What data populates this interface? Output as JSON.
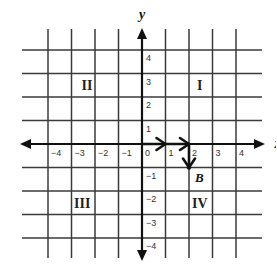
{
  "axes": {
    "x_label": "x",
    "y_label": "y",
    "x_ticks": [
      "-4",
      "-3",
      "-2",
      "-1",
      "0",
      "1",
      "2",
      "3",
      "4"
    ],
    "y_ticks": [
      "4",
      "3",
      "2",
      "1",
      "-1",
      "-2",
      "-3",
      "-4"
    ],
    "range": {
      "x": [
        -4,
        4
      ],
      "y": [
        -4,
        4
      ]
    }
  },
  "quadrants": [
    {
      "label": "I",
      "x": 2.5,
      "y": 2.5
    },
    {
      "label": "II",
      "x": -2.3,
      "y": 2.5
    },
    {
      "label": "III",
      "x": -2.5,
      "y": -2.5
    },
    {
      "label": "IV",
      "x": 2.5,
      "y": -2.5
    }
  ],
  "path": {
    "description": "Path from origin: right 2 units, then down 1 unit to point B",
    "moves": [
      {
        "from": [
          0,
          0
        ],
        "to": [
          1,
          0
        ]
      },
      {
        "from": [
          1,
          0
        ],
        "to": [
          2,
          0
        ]
      },
      {
        "from": [
          2,
          0
        ],
        "to": [
          2,
          -1
        ]
      }
    ]
  },
  "point": {
    "label": "B",
    "x": 2,
    "y": -1
  },
  "colors": {
    "grid": "#3a3a3a",
    "axis": "#111111",
    "background": "#ffffff"
  }
}
